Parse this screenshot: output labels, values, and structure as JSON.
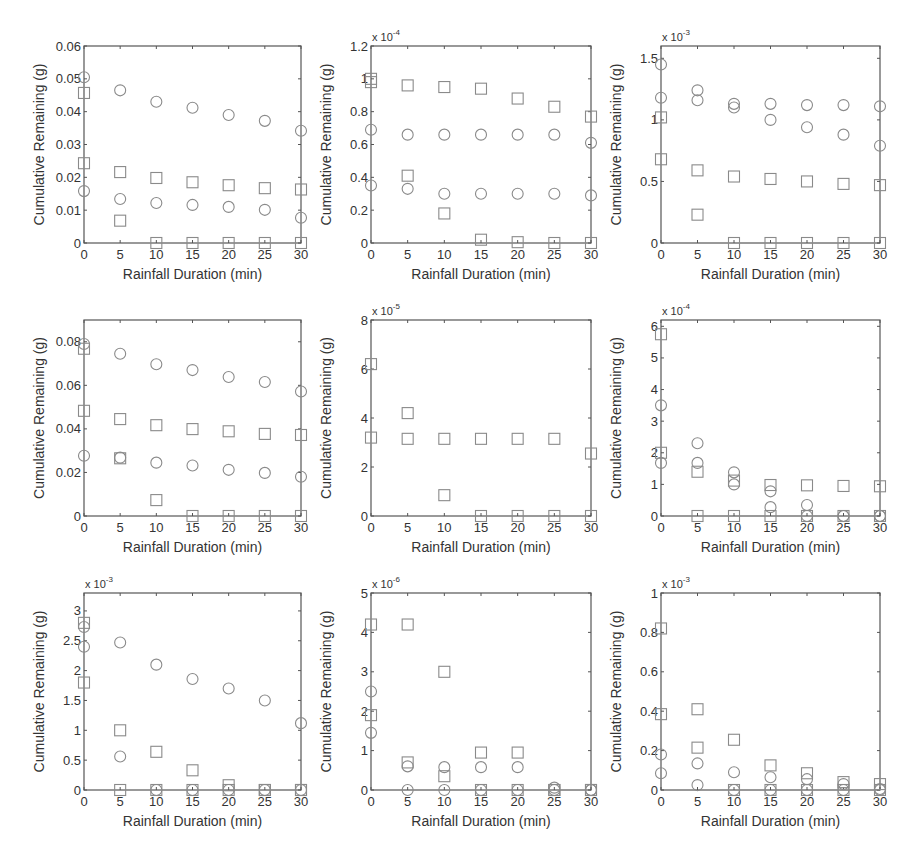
{
  "figure": {
    "xlabel": "Rainfall Duration (min)",
    "ylabel": "Cumulative Remaining (g)",
    "marker_color": "#8a8a8a",
    "axis_color": "#555555",
    "legend": {
      "panel": 8,
      "entries": [
        {
          "label": "<150µm-45mm/hr",
          "marker": "circle"
        },
        {
          "label": ">150µm-45mm/hr",
          "marker": "circle"
        },
        {
          "label": "<150µm-70mm/hr",
          "marker": "square"
        },
        {
          "label": ">150µm-70mm/hr",
          "marker": "square"
        }
      ]
    }
  },
  "chart_data": [
    {
      "type": "scatter",
      "panel": 1,
      "title": "",
      "xlabel": "Rainfall Duration (min)",
      "ylabel": "Cumulative Remaining (g)",
      "xlim": [
        0,
        30
      ],
      "ylim": [
        0,
        0.06
      ],
      "exponent_label": "",
      "xticks": [
        0,
        5,
        10,
        15,
        20,
        25,
        30
      ],
      "yticks": [
        0,
        0.01,
        0.02,
        0.03,
        0.04,
        0.05,
        0.06
      ],
      "ytick_labels": [
        "0",
        "0.01",
        "0.02",
        "0.03",
        "0.04",
        "0.05",
        "0.06"
      ],
      "x": [
        0,
        5,
        10,
        15,
        20,
        25,
        30
      ],
      "series": [
        {
          "name": "<150µm-45mm/hr",
          "marker": "circle",
          "values": [
            0.0505,
            0.0465,
            0.043,
            0.0412,
            0.039,
            0.0372,
            0.0342
          ]
        },
        {
          "name": ">150µm-45mm/hr",
          "marker": "circle",
          "values": [
            0.0158,
            0.0134,
            0.0122,
            0.0116,
            0.011,
            0.0101,
            0.0077
          ]
        },
        {
          "name": "<150µm-70mm/hr",
          "marker": "square",
          "values": [
            0.0457,
            0.0216,
            0.0198,
            0.0185,
            0.0176,
            0.0167,
            0.0163
          ]
        },
        {
          "name": ">150µm-70mm/hr",
          "marker": "square",
          "values": [
            0.0243,
            0.0068,
            0,
            0,
            0,
            0,
            0
          ]
        }
      ]
    },
    {
      "type": "scatter",
      "panel": 2,
      "title": "",
      "xlabel": "Rainfall Duration (min)",
      "ylabel": "Cumulative Remaining (g)",
      "xlim": [
        0,
        30
      ],
      "ylim": [
        0,
        1.2
      ],
      "exponent_label": "x 10",
      "exponent_power": "-4",
      "xticks": [
        0,
        5,
        10,
        15,
        20,
        25,
        30
      ],
      "yticks": [
        0,
        0.2,
        0.4,
        0.6,
        0.8,
        1,
        1.2
      ],
      "ytick_labels": [
        "0",
        "0.2",
        "0.4",
        "0.6",
        "0.8",
        "1",
        "1.2"
      ],
      "x": [
        0,
        5,
        10,
        15,
        20,
        25,
        30
      ],
      "series": [
        {
          "name": "<150µm-45mm/hr",
          "marker": "circle",
          "values": [
            0.69,
            0.66,
            0.66,
            0.66,
            0.66,
            0.66,
            0.61
          ]
        },
        {
          "name": ">150µm-45mm/hr",
          "marker": "circle",
          "values": [
            0.35,
            0.33,
            0.3,
            0.3,
            0.3,
            0.3,
            0.29
          ]
        },
        {
          "name": "<150µm-70mm/hr",
          "marker": "square",
          "values": [
            1.0,
            0.96,
            0.95,
            0.94,
            0.88,
            0.83,
            0.77
          ]
        },
        {
          "name": ">150µm-70mm/hr",
          "marker": "square",
          "values": [
            0.98,
            0.41,
            0.18,
            0.02,
            0.005,
            0,
            0
          ]
        }
      ]
    },
    {
      "type": "scatter",
      "panel": 3,
      "title": "",
      "xlabel": "Rainfall Duration (min)",
      "ylabel": "Cumulative Remaining (g)",
      "xlim": [
        0,
        30
      ],
      "ylim": [
        0,
        1.6
      ],
      "exponent_label": "x 10",
      "exponent_power": "-3",
      "xticks": [
        0,
        5,
        10,
        15,
        20,
        25,
        30
      ],
      "yticks": [
        0,
        0.5,
        1,
        1.5
      ],
      "ytick_labels": [
        "0",
        "0.5",
        "1",
        "1.5"
      ],
      "x": [
        0,
        5,
        10,
        15,
        20,
        25,
        30
      ],
      "series": [
        {
          "name": "<150µm-45mm/hr",
          "marker": "circle",
          "values": [
            1.45,
            1.24,
            1.13,
            1.13,
            1.12,
            1.12,
            1.11
          ]
        },
        {
          "name": ">150µm-45mm/hr",
          "marker": "circle",
          "values": [
            1.18,
            1.16,
            1.1,
            1.0,
            0.94,
            0.88,
            0.79
          ]
        },
        {
          "name": "<150µm-70mm/hr",
          "marker": "square",
          "values": [
            1.02,
            0.59,
            0.54,
            0.52,
            0.5,
            0.48,
            0.47
          ]
        },
        {
          "name": ">150µm-70mm/hr",
          "marker": "square",
          "values": [
            0.68,
            0.23,
            0,
            0,
            0,
            0,
            0
          ]
        }
      ]
    },
    {
      "type": "scatter",
      "panel": 4,
      "title": "",
      "xlabel": "Rainfall Duration (min)",
      "ylabel": "Cumulative Remaining (g)",
      "xlim": [
        0,
        30
      ],
      "ylim": [
        0,
        0.09
      ],
      "exponent_label": "",
      "xticks": [
        0,
        5,
        10,
        15,
        20,
        25,
        30
      ],
      "yticks": [
        0,
        0.02,
        0.04,
        0.06,
        0.08
      ],
      "ytick_labels": [
        "0",
        "0.02",
        "0.04",
        "0.06",
        "0.08"
      ],
      "x": [
        0,
        5,
        10,
        15,
        20,
        25,
        30
      ],
      "series": [
        {
          "name": "<150µm-45mm/hr",
          "marker": "circle",
          "values": [
            0.079,
            0.0745,
            0.0697,
            0.067,
            0.0638,
            0.0615,
            0.0572
          ]
        },
        {
          "name": ">150µm-45mm/hr",
          "marker": "circle",
          "values": [
            0.0277,
            0.0268,
            0.0245,
            0.0232,
            0.0212,
            0.0198,
            0.018
          ]
        },
        {
          "name": "<150µm-70mm/hr",
          "marker": "square",
          "values": [
            0.0768,
            0.0445,
            0.0417,
            0.0399,
            0.0389,
            0.0377,
            0.0372
          ]
        },
        {
          "name": ">150µm-70mm/hr",
          "marker": "square",
          "values": [
            0.0483,
            0.0265,
            0.0073,
            0,
            0,
            0,
            0
          ]
        }
      ]
    },
    {
      "type": "scatter",
      "panel": 5,
      "title": "",
      "xlabel": "Rainfall Duration (min)",
      "ylabel": "Cumulative Remaining (g)",
      "xlim": [
        0,
        30
      ],
      "ylim": [
        0,
        8
      ],
      "exponent_label": "x 10",
      "exponent_power": "-5",
      "xticks": [
        0,
        5,
        10,
        15,
        20,
        25,
        30
      ],
      "yticks": [
        0,
        2,
        4,
        6,
        8
      ],
      "ytick_labels": [
        "0",
        "2",
        "4",
        "6",
        "8"
      ],
      "x": [
        0,
        5,
        10,
        15,
        20,
        25,
        30
      ],
      "series": [
        {
          "name": "<150µm-45mm/hr",
          "marker": "circle",
          "values": [
            null,
            null,
            null,
            null,
            null,
            null,
            null
          ]
        },
        {
          "name": ">150µm-45mm/hr",
          "marker": "circle",
          "values": [
            null,
            null,
            null,
            null,
            null,
            null,
            null
          ]
        },
        {
          "name": "<150µm-70mm/hr",
          "marker": "square",
          "values": [
            6.2,
            4.2,
            3.15,
            3.15,
            3.15,
            3.15,
            2.55
          ]
        },
        {
          "name": ">150µm-70mm/hr",
          "marker": "square",
          "values": [
            3.2,
            3.15,
            0.85,
            0,
            0,
            0,
            0
          ]
        }
      ]
    },
    {
      "type": "scatter",
      "panel": 6,
      "title": "",
      "xlabel": "Rainfall Duration (min)",
      "ylabel": "Cumulative Remaining (g)",
      "xlim": [
        0,
        30
      ],
      "ylim": [
        0,
        6.2
      ],
      "exponent_label": "x 10",
      "exponent_power": "-4",
      "xticks": [
        0,
        5,
        10,
        15,
        20,
        25,
        30
      ],
      "yticks": [
        0,
        1,
        2,
        3,
        4,
        5,
        6
      ],
      "ytick_labels": [
        "0",
        "1",
        "2",
        "3",
        "4",
        "5",
        "6"
      ],
      "x": [
        0,
        5,
        10,
        15,
        20,
        25,
        30
      ],
      "series": [
        {
          "name": "<150µm-45mm/hr",
          "marker": "circle",
          "values": [
            3.5,
            2.3,
            1.38,
            0.78,
            0.35,
            0,
            0
          ]
        },
        {
          "name": ">150µm-45mm/hr",
          "marker": "circle",
          "values": [
            1.68,
            1.68,
            1.0,
            0.28,
            0,
            0,
            0
          ]
        },
        {
          "name": "<150µm-70mm/hr",
          "marker": "square",
          "values": [
            5.75,
            1.4,
            1.12,
            0.98,
            0.97,
            0.95,
            0.94
          ]
        },
        {
          "name": ">150µm-70mm/hr",
          "marker": "square",
          "values": [
            2.0,
            0,
            0,
            0,
            0,
            0,
            0
          ]
        }
      ]
    },
    {
      "type": "scatter",
      "panel": 7,
      "title": "",
      "xlabel": "Rainfall Duration (min)",
      "ylabel": "Cumulative Remaining (g)",
      "xlim": [
        0,
        30
      ],
      "ylim": [
        0,
        3.3
      ],
      "exponent_label": "x 10",
      "exponent_power": "-3",
      "xticks": [
        0,
        5,
        10,
        15,
        20,
        25,
        30
      ],
      "yticks": [
        0,
        0.5,
        1,
        1.5,
        2,
        2.5,
        3
      ],
      "ytick_labels": [
        "0",
        "0.5",
        "1",
        "1.5",
        "2",
        "2.5",
        "3"
      ],
      "x": [
        0,
        5,
        10,
        15,
        20,
        25,
        30
      ],
      "series": [
        {
          "name": "<150µm-45mm/hr",
          "marker": "circle",
          "values": [
            2.73,
            2.47,
            2.1,
            1.86,
            1.7,
            1.5,
            1.12
          ]
        },
        {
          "name": ">150µm-45mm/hr",
          "marker": "circle",
          "values": [
            2.4,
            0.56,
            0,
            0,
            0,
            0,
            0
          ]
        },
        {
          "name": "<150µm-70mm/hr",
          "marker": "square",
          "values": [
            2.8,
            1.0,
            0.64,
            0.33,
            0.08,
            0,
            0
          ]
        },
        {
          "name": ">150µm-70mm/hr",
          "marker": "square",
          "values": [
            1.8,
            0,
            0,
            0,
            0,
            0,
            0
          ]
        }
      ]
    },
    {
      "type": "scatter",
      "panel": 8,
      "title": "",
      "xlabel": "Rainfall Duration (min)",
      "ylabel": "Cumulative Remaining (g)",
      "xlim": [
        0,
        30
      ],
      "ylim": [
        0,
        5
      ],
      "exponent_label": "x 10",
      "exponent_power": "-6",
      "xticks": [
        0,
        5,
        10,
        15,
        20,
        25,
        30
      ],
      "yticks": [
        0,
        1,
        2,
        3,
        4,
        5
      ],
      "ytick_labels": [
        "0",
        "1",
        "2",
        "3",
        "4",
        "5"
      ],
      "x": [
        0,
        5,
        10,
        15,
        20,
        25,
        30
      ],
      "series": [
        {
          "name": "<150µm-45mm/hr",
          "marker": "circle",
          "values": [
            2.5,
            0.6,
            0.58,
            0.58,
            0.58,
            0.06,
            0
          ]
        },
        {
          "name": ">150µm-45mm/hr",
          "marker": "circle",
          "values": [
            1.45,
            0,
            0,
            0,
            0,
            0,
            0
          ]
        },
        {
          "name": "<150µm-70mm/hr",
          "marker": "square",
          "values": [
            4.2,
            4.2,
            3.0,
            0.95,
            0.95,
            0,
            0
          ]
        },
        {
          "name": ">150µm-70mm/hr",
          "marker": "square",
          "values": [
            1.9,
            0.7,
            0.35,
            0,
            0,
            0,
            0
          ]
        }
      ]
    },
    {
      "type": "scatter",
      "panel": 9,
      "title": "",
      "xlabel": "Rainfall Duration (min)",
      "ylabel": "Cumulative Remaining (g)",
      "xlim": [
        0,
        30
      ],
      "ylim": [
        0,
        1
      ],
      "exponent_label": "x 10",
      "exponent_power": "-3",
      "xticks": [
        0,
        5,
        10,
        15,
        20,
        25,
        30
      ],
      "yticks": [
        0,
        0.2,
        0.4,
        0.6,
        0.8,
        1
      ],
      "ytick_labels": [
        "0",
        "0.2",
        "0.4",
        "0.6",
        "0.8",
        "1"
      ],
      "x": [
        0,
        5,
        10,
        15,
        20,
        25,
        30
      ],
      "series": [
        {
          "name": "<150µm-45mm/hr",
          "marker": "circle",
          "values": [
            0.18,
            0.135,
            0.09,
            0.065,
            0.055,
            0.03,
            0.005
          ]
        },
        {
          "name": ">150µm-45mm/hr",
          "marker": "circle",
          "values": [
            0.085,
            0.025,
            0,
            0,
            0,
            0,
            0
          ]
        },
        {
          "name": "<150µm-70mm/hr",
          "marker": "square",
          "values": [
            0.82,
            0.41,
            0.255,
            0.125,
            0.085,
            0.04,
            0.03
          ]
        },
        {
          "name": ">150µm-70mm/hr",
          "marker": "square",
          "values": [
            0.385,
            0.215,
            0,
            0,
            0,
            0,
            0
          ]
        }
      ]
    }
  ]
}
